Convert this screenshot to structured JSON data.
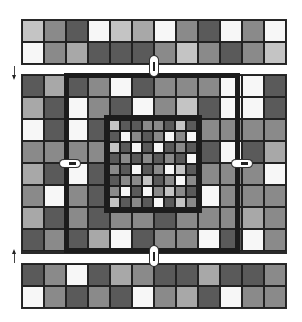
{
  "diagram": {
    "palette": {
      "w": "#f7f7f7",
      "l": "#c4c4c4",
      "lm": "#a8a8a8",
      "m": "#8a8a8a",
      "dm": "#707070",
      "d": "#5a5a5a",
      "border": "#1c1c1c"
    },
    "top_band": {
      "rows": 2,
      "cols": 12,
      "cells": [
        [
          "l",
          "m",
          "d",
          "w",
          "l",
          "lm",
          "w",
          "m",
          "d",
          "w",
          "m",
          "w"
        ],
        [
          "w",
          "m",
          "lm",
          "d",
          "d",
          "d",
          "m",
          "l",
          "m",
          "d",
          "m",
          "l"
        ]
      ]
    },
    "middle_block": {
      "rows": 8,
      "cols": 12,
      "cells": [
        [
          "d",
          "lm",
          "d",
          "m",
          "w",
          "d",
          "m",
          "m",
          "m",
          "w",
          "w",
          "d"
        ],
        [
          "lm",
          "d",
          "w",
          "m",
          "d",
          "w",
          "m",
          "l",
          "d",
          "w",
          "w",
          "d"
        ],
        [
          "w",
          "d",
          "w",
          "d",
          "d",
          "m",
          "m",
          "m",
          "m",
          "m",
          "m",
          "m"
        ],
        [
          "m",
          "m",
          "m",
          "m",
          "d",
          "m",
          "m",
          "m",
          "d",
          "w",
          "d",
          "lm"
        ],
        [
          "lm",
          "d",
          "w",
          "d",
          "d",
          "m",
          "m",
          "m",
          "m",
          "m",
          "m",
          "w"
        ],
        [
          "m",
          "w",
          "m",
          "d",
          "d",
          "m",
          "m",
          "m",
          "w",
          "m",
          "m",
          "m"
        ],
        [
          "lm",
          "d",
          "m",
          "d",
          "m",
          "m",
          "d",
          "m",
          "m",
          "m",
          "lm",
          "m"
        ],
        [
          "d",
          "m",
          "d",
          "lm",
          "w",
          "d",
          "m",
          "m",
          "w",
          "d",
          "w",
          "m"
        ]
      ]
    },
    "inner_grid": {
      "rows": 8,
      "cols": 8,
      "cells": [
        [
          "l",
          "d",
          "d",
          "m",
          "m",
          "d",
          "l",
          "d"
        ],
        [
          "d",
          "w",
          "m",
          "d",
          "m",
          "w",
          "m",
          "w"
        ],
        [
          "l",
          "d",
          "w",
          "d",
          "w",
          "d",
          "m",
          "d"
        ],
        [
          "d",
          "m",
          "d",
          "m",
          "d",
          "m",
          "d",
          "w"
        ],
        [
          "m",
          "d",
          "w",
          "d",
          "m",
          "w",
          "l",
          "d"
        ],
        [
          "d",
          "m",
          "m",
          "l",
          "d",
          "m",
          "w",
          "m"
        ],
        [
          "m",
          "w",
          "d",
          "w",
          "m",
          "l",
          "m",
          "d"
        ],
        [
          "l",
          "d",
          "m",
          "d",
          "w",
          "d",
          "l",
          "m"
        ]
      ]
    },
    "bottom_band": {
      "rows": 2,
      "cols": 12,
      "cells": [
        [
          "d",
          "m",
          "w",
          "d",
          "lm",
          "m",
          "d",
          "d",
          "lm",
          "d",
          "d",
          "m"
        ],
        [
          "w",
          "m",
          "d",
          "m",
          "d",
          "w",
          "m",
          "lm",
          "d",
          "w",
          "m",
          "m"
        ]
      ]
    },
    "connectors": [
      {
        "name": "top",
        "orientation": "vertical"
      },
      {
        "name": "bottom",
        "orientation": "vertical"
      },
      {
        "name": "left",
        "orientation": "horizontal"
      },
      {
        "name": "right",
        "orientation": "horizontal"
      }
    ],
    "arrows": [
      {
        "name": "down",
        "direction": "down"
      },
      {
        "name": "up",
        "direction": "up"
      }
    ]
  }
}
